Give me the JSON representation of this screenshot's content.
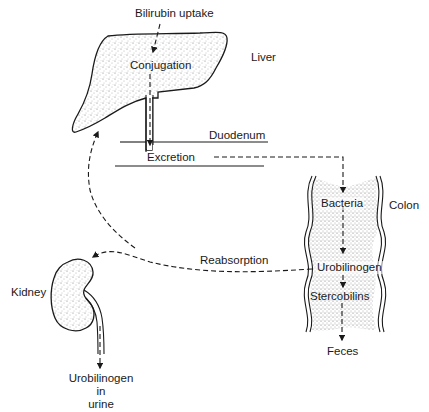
{
  "diagram": {
    "type": "physiology-flow",
    "colors": {
      "stroke": "#1a1a1a",
      "fill": "#ffffff",
      "stipple": "#555555",
      "text": "#1a1a1a"
    },
    "organs": {
      "liver": "Liver",
      "duodenum": "Duodenum",
      "colon": "Colon",
      "kidney": "Kidney"
    },
    "steps": {
      "uptake": "Bilirubin uptake",
      "conjugation": "Conjugation",
      "excretion": "Excretion",
      "bacteria": "Bacteria",
      "urobilinogen": "Urobilinogen",
      "stercobilins": "Stercobilins",
      "feces": "Feces",
      "reabsorption": "Reabsorption",
      "urine_line1": "Urobilinogen",
      "urine_line2": "in",
      "urine_line3": "urine"
    },
    "flows": [
      {
        "from": "Bilirubin uptake",
        "to": "Conjugation"
      },
      {
        "from": "Conjugation",
        "to": "Excretion"
      },
      {
        "from": "Excretion",
        "to": "Bacteria"
      },
      {
        "from": "Bacteria",
        "to": "Urobilinogen"
      },
      {
        "from": "Urobilinogen",
        "to": "Stercobilins"
      },
      {
        "from": "Stercobilins",
        "to": "Feces"
      },
      {
        "from": "Urobilinogen",
        "to": "Liver",
        "via": "Reabsorption"
      },
      {
        "from": "Urobilinogen",
        "to": "Kidney",
        "via": "Reabsorption"
      },
      {
        "from": "Kidney",
        "to": "Urobilinogen in urine"
      }
    ]
  }
}
